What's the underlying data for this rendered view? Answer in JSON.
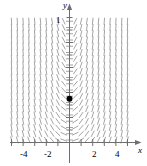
{
  "chart_data": {
    "type": "line",
    "title": "",
    "subtitle": "",
    "xlabel": "x",
    "ylabel": "y",
    "grid": false,
    "legend": null,
    "xlim": [
      -5.2,
      5.6
    ],
    "ylim": [
      -0.55,
      5.3
    ],
    "x_ticks": [
      -5,
      -4,
      -3,
      -2,
      -1,
      1,
      2,
      3,
      4,
      5
    ],
    "x_tick_labels": [
      "",
      "-4",
      "",
      "-2",
      "",
      "",
      "2",
      "",
      "4",
      ""
    ],
    "y_ticks": [
      1,
      2,
      3,
      4
    ],
    "y_tick_labels": [
      "1",
      "",
      "",
      ""
    ],
    "y_axis_visible_label": "1",
    "field": {
      "description": "slope field segments, slope = x*y-like fanning: horizontal near x=0, steepening away from the y-axis",
      "x_range": [
        -5,
        5
      ],
      "y_range": [
        0.1,
        5.0
      ],
      "x_step": 0.5,
      "y_step": 0.25,
      "segment_color": "#9a9a9a",
      "segment_length_px": 7
    },
    "points": [
      {
        "name": "initial-condition",
        "x": 0,
        "y": 1.75,
        "marker": "filled-circle",
        "color": "#000000",
        "size_px": 6
      }
    ],
    "axis_color": "#6e6e6e",
    "tick_color": "#6e6e6e",
    "text_color": "#000000"
  },
  "labels": {
    "x_axis": "x",
    "y_axis": "y",
    "x_neg4": "-4",
    "x_neg2": "-2",
    "x_pos2": "2",
    "x_pos4": "4",
    "y_one": "1"
  }
}
